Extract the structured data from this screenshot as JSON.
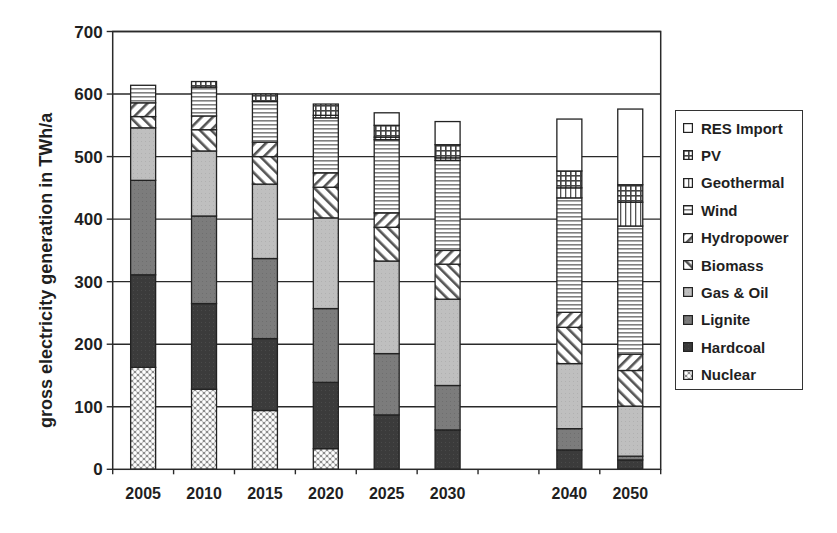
{
  "chart_data": {
    "type": "bar",
    "stacked": true,
    "title": "",
    "xlabel": "",
    "ylabel": "gross electricity generation in TWh/a",
    "ylim": [
      0,
      700
    ],
    "yticks": [
      0,
      100,
      200,
      300,
      400,
      500,
      600,
      700
    ],
    "grid": "horizontal",
    "legend_position": "right",
    "category_slots": [
      "2005",
      "2010",
      "2015",
      "2020",
      "2025",
      "2030",
      "",
      "2040",
      "2050"
    ],
    "categories": [
      "2005",
      "2010",
      "2015",
      "2020",
      "2025",
      "2030",
      "2040",
      "2050"
    ],
    "series": [
      {
        "name": "Nuclear",
        "pattern": "crosshatch-dots",
        "color": "#d9d9d9",
        "values": [
          163,
          128,
          94,
          33,
          0,
          0,
          0,
          0
        ]
      },
      {
        "name": "Hardcoal",
        "pattern": "solid",
        "color": "#3a3a3a",
        "values": [
          148,
          137,
          115,
          106,
          87,
          63,
          31,
          15
        ]
      },
      {
        "name": "Lignite",
        "pattern": "solid",
        "color": "#7a7a7a",
        "values": [
          151,
          140,
          128,
          118,
          98,
          71,
          34,
          6
        ]
      },
      {
        "name": "Gas & Oil",
        "pattern": "solid",
        "color": "#bdbdbd",
        "values": [
          84,
          104,
          119,
          145,
          148,
          138,
          104,
          80
        ]
      },
      {
        "name": "Biomass",
        "pattern": "diagonal-forward",
        "color": "#ffffff",
        "values": [
          18,
          34,
          44,
          49,
          54,
          56,
          58,
          57
        ]
      },
      {
        "name": "Hydropower",
        "pattern": "diagonal-back",
        "color": "#ffffff",
        "values": [
          22,
          22,
          23,
          23,
          23,
          22,
          24,
          26
        ]
      },
      {
        "name": "Wind",
        "pattern": "horizontal",
        "color": "#ffffff",
        "values": [
          28,
          46,
          65,
          88,
          117,
          144,
          183,
          205
        ]
      },
      {
        "name": "Geothermal",
        "pattern": "vertical",
        "color": "#ffffff",
        "values": [
          0,
          0,
          0,
          4,
          4,
          4,
          16,
          38
        ]
      },
      {
        "name": "PV",
        "pattern": "grid",
        "color": "#9a9a9a",
        "values": [
          0,
          9,
          12,
          18,
          19,
          21,
          27,
          28
        ]
      },
      {
        "name": "RES Import",
        "pattern": "solid",
        "color": "#ffffff",
        "values": [
          0,
          0,
          0,
          0,
          20,
          37,
          83,
          121
        ]
      }
    ],
    "totals": [
      614,
      620,
      600,
      584,
      570,
      556,
      560,
      576
    ]
  },
  "legend": {
    "items": [
      {
        "label": "RES Import",
        "pattern": "solid-white"
      },
      {
        "label": "PV",
        "pattern": "grid"
      },
      {
        "label": "Geothermal",
        "pattern": "vertical"
      },
      {
        "label": "Wind",
        "pattern": "horizontal"
      },
      {
        "label": "Hydropower",
        "pattern": "diagonal-back"
      },
      {
        "label": "Biomass",
        "pattern": "diagonal-forward"
      },
      {
        "label": "Gas & Oil",
        "pattern": "light-gray"
      },
      {
        "label": "Lignite",
        "pattern": "mid-gray"
      },
      {
        "label": "Hardcoal",
        "pattern": "dark-gray"
      },
      {
        "label": "Nuclear",
        "pattern": "crosshatch-dots"
      }
    ]
  }
}
